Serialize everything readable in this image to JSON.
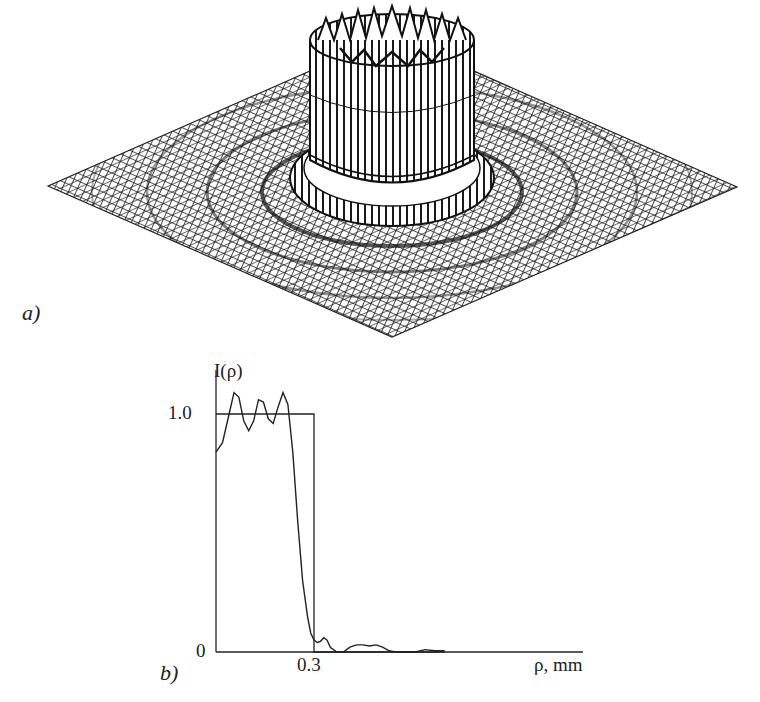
{
  "panel_a": {
    "label": "a)",
    "description": "3D mesh surface plot of intensity: flat-top cylinder with concentric ripple rings on a square grid"
  },
  "panel_b": {
    "label": "b)",
    "ylabel": "I(ρ)",
    "xlabel": "ρ, mm",
    "ytick_1": "1.0",
    "ytick_0": "0",
    "xtick_03": "0.3"
  },
  "colors": {
    "line": "#2a2a2a",
    "mesh": "#1e1e1e",
    "background": "#ffffff"
  },
  "chart_data": [
    {
      "type": "surface",
      "title": "",
      "panel": "a)",
      "description": "Intensity distribution I(x,y): flat-top circular profile (radius ~0.3 mm) with diffraction ripples",
      "grid": "square mesh, isometric view"
    },
    {
      "type": "line",
      "panel": "b)",
      "title": "",
      "xlabel": "ρ, mm",
      "ylabel": "I(ρ)",
      "yticks": [
        "0",
        "1.0"
      ],
      "xticks": [
        "0.3"
      ],
      "ylim": [
        0,
        1.15
      ],
      "xlim": [
        0,
        0.7
      ],
      "series": [
        {
          "name": "computed I(ρ)",
          "x": [
            0.0,
            0.02,
            0.04,
            0.055,
            0.07,
            0.085,
            0.1,
            0.115,
            0.13,
            0.145,
            0.16,
            0.175,
            0.19,
            0.205,
            0.22,
            0.235,
            0.25,
            0.265,
            0.28,
            0.29,
            0.3,
            0.31,
            0.32,
            0.33,
            0.34,
            0.35,
            0.37,
            0.39,
            0.41,
            0.43,
            0.45,
            0.47,
            0.49,
            0.51,
            0.53,
            0.55,
            0.58,
            0.61,
            0.64,
            0.67,
            0.7
          ],
          "y": [
            0.84,
            0.88,
            1.0,
            1.09,
            1.07,
            0.97,
            0.93,
            0.97,
            1.06,
            1.05,
            0.98,
            0.96,
            1.03,
            1.09,
            1.04,
            0.84,
            0.55,
            0.3,
            0.15,
            0.08,
            0.05,
            0.04,
            0.045,
            0.06,
            0.05,
            0.02,
            0.0,
            0.0,
            0.02,
            0.03,
            0.03,
            0.025,
            0.03,
            0.02,
            0.005,
            0.0,
            0.0,
            0.0,
            0.01,
            0.005,
            0.005
          ]
        },
        {
          "name": "ideal flat-top",
          "x": [
            0.0,
            0.3,
            0.3,
            0.7
          ],
          "y": [
            1.0,
            1.0,
            0.0,
            0.0
          ]
        }
      ]
    }
  ]
}
